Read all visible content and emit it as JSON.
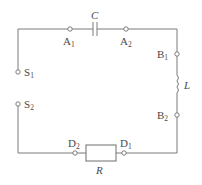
{
  "diagram": {
    "type": "circuit",
    "colors": {
      "wire": "#7a7a7a",
      "label": "#4a4a4a",
      "background": "#ffffff"
    },
    "components": {
      "capacitor": {
        "symbol": "C"
      },
      "inductor": {
        "symbol": "L"
      },
      "resistor": {
        "symbol": "R"
      }
    },
    "terminals": {
      "A1": {
        "letter": "A",
        "sub": "1"
      },
      "A2": {
        "letter": "A",
        "sub": "2"
      },
      "B1": {
        "letter": "B",
        "sub": "1"
      },
      "B2": {
        "letter": "B",
        "sub": "2"
      },
      "D1": {
        "letter": "D",
        "sub": "1"
      },
      "D2": {
        "letter": "D",
        "sub": "2"
      },
      "S1": {
        "letter": "S",
        "sub": "1"
      },
      "S2": {
        "letter": "S",
        "sub": "2"
      }
    }
  }
}
